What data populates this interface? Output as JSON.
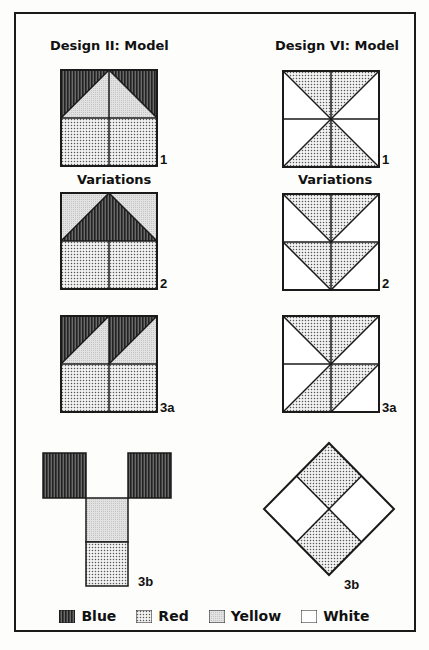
{
  "left_column": {
    "title": "Design II: Model",
    "variations_label": "Variations",
    "labels": {
      "model": "1",
      "variation_2": "2",
      "variation_3a": "3a",
      "variation_3b": "3b"
    }
  },
  "right_column": {
    "title": "Design VI: Model",
    "variations_label": "Variations",
    "labels": {
      "model": "1",
      "variation_2": "2",
      "variation_3a": "3a",
      "variation_3b": "3b"
    }
  },
  "legend": {
    "items": [
      {
        "name": "Blue",
        "pattern": "vertical-stripes"
      },
      {
        "name": "Red",
        "pattern": "dots"
      },
      {
        "name": "Yellow",
        "pattern": "fine-gray"
      },
      {
        "name": "White",
        "pattern": "none"
      }
    ]
  },
  "colors": {
    "stroke": "#1a1a1a",
    "blue_dark": "#3a3a3a",
    "red_dot": "#555555",
    "yellow_gray": "#d8d8d8",
    "white": "#ffffff"
  }
}
